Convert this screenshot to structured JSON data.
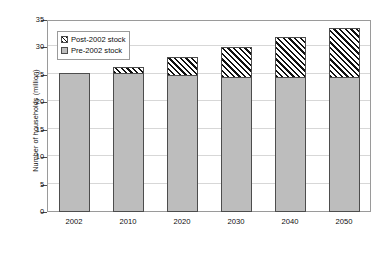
{
  "chart_data": {
    "type": "bar",
    "stacked": true,
    "title": "",
    "xlabel": "",
    "ylabel": "Number of households (million)",
    "categories": [
      "2002",
      "2010",
      "2020",
      "2030",
      "2040",
      "2050"
    ],
    "ylim": [
      0,
      35
    ],
    "yticks": [
      0,
      5,
      10,
      15,
      20,
      25,
      30,
      35
    ],
    "ytick_labels": [
      "0",
      "5",
      "10",
      "15",
      "20",
      "25",
      "30",
      "35"
    ],
    "grid": "horizontal",
    "legend_position": "upper-left-inside",
    "series": [
      {
        "name": "Pre-2002 stock",
        "fill": "#bdbdbd",
        "pattern": "solid-gray",
        "values": [
          25.4,
          25.3,
          24.9,
          24.7,
          24.6,
          24.6
        ]
      },
      {
        "name": "Post-2002 stock",
        "fill": "#ffffff",
        "pattern": "diagonal-hatch",
        "values": [
          0.0,
          1.4,
          3.6,
          5.6,
          7.4,
          9.1
        ]
      }
    ],
    "totals": [
      25.4,
      26.7,
      28.5,
      30.3,
      32.0,
      33.7
    ],
    "colors": {
      "pre_2002": "#bdbdbd",
      "post_2002_hatch": "#111111",
      "axis": "#4a4a4a",
      "grid": "#d7d7d7",
      "frame": "#9a9a9a",
      "text": "#0d0d0d"
    }
  },
  "legend": {
    "items": [
      {
        "label": "Post-2002 stock",
        "swatch": "hatch-swatch-icon"
      },
      {
        "label": "Pre-2002 stock",
        "swatch": "gray-swatch-icon"
      }
    ]
  },
  "axes": {
    "y_title": "Number of households (million)"
  }
}
